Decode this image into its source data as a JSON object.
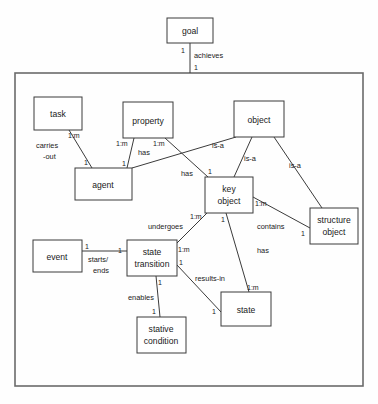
{
  "diagram": {
    "frame": {
      "name": "outer-boundary",
      "x": 15,
      "y": 73,
      "width": 348,
      "height": 313
    },
    "entities": [
      {
        "id": "goal",
        "label": "goal",
        "x": 167,
        "y": 18,
        "width": 46,
        "height": 25
      },
      {
        "id": "task",
        "label": "task",
        "x": 34,
        "y": 97,
        "width": 48,
        "height": 33
      },
      {
        "id": "property",
        "label": "property",
        "x": 123,
        "y": 102,
        "width": 50,
        "height": 36
      },
      {
        "id": "object",
        "label": "object",
        "x": 234,
        "y": 101,
        "width": 50,
        "height": 36
      },
      {
        "id": "agent",
        "label": "agent",
        "x": 75,
        "y": 168,
        "width": 57,
        "height": 32
      },
      {
        "id": "key-object",
        "label": "key\nobject",
        "x": 205,
        "y": 177,
        "width": 48,
        "height": 36
      },
      {
        "id": "structure-object",
        "label": "structure\nobject",
        "x": 310,
        "y": 208,
        "width": 48,
        "height": 36
      },
      {
        "id": "event",
        "label": "event",
        "x": 33,
        "y": 240,
        "width": 49,
        "height": 32
      },
      {
        "id": "state-transition",
        "label": "state\ntransition",
        "x": 127,
        "y": 240,
        "width": 50,
        "height": 36
      },
      {
        "id": "state",
        "label": "state",
        "x": 221,
        "y": 292,
        "width": 50,
        "height": 34
      },
      {
        "id": "stative-condition",
        "label": "stative\ncondition",
        "x": 137,
        "y": 317,
        "width": 49,
        "height": 36
      }
    ],
    "relationships": [
      {
        "id": "goal-achieves",
        "label": "achieves",
        "from": "goal",
        "to": "frame",
        "from_card": "1",
        "to_card": "1"
      },
      {
        "id": "task-carries-out-agent",
        "label": "carries\n-out",
        "from": "task",
        "to": "agent",
        "from_card": "1:m",
        "to_card": "1"
      },
      {
        "id": "property-has-agent",
        "label": "has",
        "from": "property",
        "to": "agent",
        "from_card": "1:m",
        "to_card": "1"
      },
      {
        "id": "property-has-key-object",
        "label": "has",
        "from": "property",
        "to": "key-object",
        "from_card": "1:m",
        "to_card": "1"
      },
      {
        "id": "object-is-a-agent",
        "label": "is-a",
        "from": "object",
        "to": "agent",
        "from_card": "",
        "to_card": ""
      },
      {
        "id": "object-is-a-key-object",
        "label": "is-a",
        "from": "object",
        "to": "key-object",
        "from_card": "",
        "to_card": ""
      },
      {
        "id": "object-is-a-structure",
        "label": "is-a",
        "from": "object",
        "to": "structure-object",
        "from_card": "",
        "to_card": ""
      },
      {
        "id": "key-object-contains",
        "label": "contains",
        "from": "key-object",
        "to": "structure-object",
        "from_card": "1:m",
        "to_card": "1"
      },
      {
        "id": "key-object-undergoes",
        "label": "undergoes",
        "from": "key-object",
        "to": "state-transition",
        "from_card": "1:m",
        "to_card": "1:m"
      },
      {
        "id": "key-object-has-state",
        "label": "has",
        "from": "key-object",
        "to": "state",
        "from_card": "1",
        "to_card": "1:m"
      },
      {
        "id": "event-starts-ends",
        "label": "starts/\nends",
        "from": "event",
        "to": "state-transition",
        "from_card": "1",
        "to_card": "1"
      },
      {
        "id": "transition-results-in",
        "label": "results-in",
        "from": "state-transition",
        "to": "state",
        "from_card": "1",
        "to_card": "1"
      },
      {
        "id": "transition-enables",
        "label": "enables",
        "from": "state-transition",
        "to": "stative-condition",
        "from_card": "1",
        "to_card": "1"
      }
    ],
    "text": {
      "goal": "goal",
      "task": "task",
      "property": "property",
      "object": "object",
      "agent": "agent",
      "key_line1": "key",
      "key_line2": "object",
      "structure_line1": "structure",
      "structure_line2": "object",
      "event": "event",
      "transition_line1": "state",
      "transition_line2": "transition",
      "state": "state",
      "stative_line1": "stative",
      "stative_line2": "condition",
      "achieves": "achieves",
      "carries_line1": "carries",
      "carries_line2": "-out",
      "has_left": "has",
      "has_mid": "has",
      "has_lower": "has",
      "is_a_left": "is-a",
      "is_a_mid": "is-a",
      "is_a_right": "is-a",
      "contains": "contains",
      "undergoes": "undergoes",
      "starts_line1": "starts/",
      "starts_line2": "ends",
      "results_in": "results-in",
      "enables": "enables",
      "one": "1",
      "one_m": "1:m"
    },
    "colors": {
      "background": "#fefefe",
      "box_stroke": "#3b3b3b",
      "frame_stroke": "#6b6b6b",
      "text": "#1a1a1a"
    }
  }
}
